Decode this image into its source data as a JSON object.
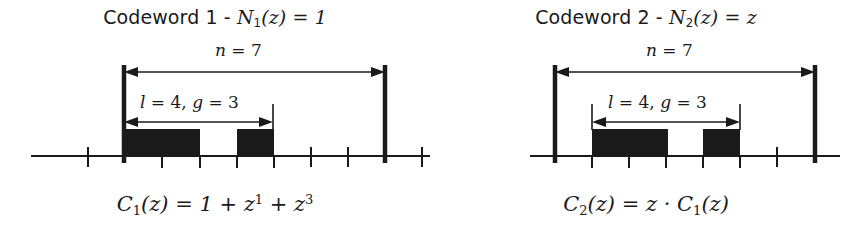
{
  "figure": {
    "background_color": "#ffffff",
    "ink_color": "#1a1a1a",
    "width": 861,
    "height": 235
  },
  "panels": [
    {
      "id": "codeword-1",
      "title_prefix": "Codeword 1 - ",
      "title_symbol": "N",
      "title_symbol_sub": "1",
      "title_symbol_arg": "(z) = 1",
      "title_full": "Codeword 1 - N₁(z) = 1",
      "formula_lead": "C",
      "formula_lead_sub": "1",
      "formula_rest": "(z) = 1 + z",
      "formula_sup_1": "1",
      "formula_mid": " + z",
      "formula_sup_2": "3",
      "formula_full": "C₁(z) = 1 + z¹ + z³",
      "span_label": {
        "var": "n",
        "eq": " = ",
        "value": "7",
        "text": "n = 7"
      },
      "window_label": {
        "var_l": "l",
        "eq_l": " = ",
        "val_l": "4, ",
        "var_g": "g",
        "eq_g": " = ",
        "val_g": "3",
        "text": "l = 4, g = 3"
      },
      "axis": {
        "baseline_y": 156,
        "x_start": 31,
        "x_end": 460,
        "tick_spacing": 37.3,
        "tick_positions": [
          88,
          125,
          162,
          200,
          237,
          274,
          311,
          348,
          385,
          422
        ],
        "tick_top": 148,
        "tick_bottom": 166
      },
      "boundaries": {
        "left_x": 124,
        "right_x": 385,
        "top_y": 65,
        "bottom_y": 163
      },
      "span_arrow": {
        "y": 72,
        "x1": 124,
        "x2": 385
      },
      "window_arrow": {
        "y": 122,
        "x1": 124,
        "x2": 273,
        "tick_x": 273,
        "tick_top": 104,
        "tick_bottom": 130
      },
      "bars": [
        {
          "x": 124,
          "width": 76,
          "top_y": 129,
          "bottom_y": 157
        },
        {
          "x": 237,
          "width": 37,
          "top_y": 129,
          "bottom_y": 157
        }
      ]
    },
    {
      "id": "codeword-2",
      "title_prefix": "Codeword 2 - ",
      "title_symbol": "N",
      "title_symbol_sub": "2",
      "title_symbol_arg": "(z) = z",
      "title_full": "Codeword 2 - N₂(z) = z",
      "formula_lead": "C",
      "formula_lead_sub": "2",
      "formula_rest": "(z) = z · C",
      "formula_sup_1": "",
      "formula_mid": "",
      "formula_sup_2": "",
      "formula_tail_sub": "1",
      "formula_tail": "(z)",
      "formula_full": "C₂(z) = z · C₁(z)",
      "span_label": {
        "var": "n",
        "eq": " = ",
        "value": "7",
        "text": "n = 7"
      },
      "window_label": {
        "var_l": "l",
        "eq_l": " = ",
        "val_l": "4, ",
        "var_g": "g",
        "eq_g": " = ",
        "val_g": "3",
        "text": "l = 4, g = 3"
      },
      "axis": {
        "baseline_y": 156,
        "x_start": 99,
        "x_end": 409,
        "tick_spacing": 37.3,
        "tick_positions": [
          124,
          161,
          198,
          235,
          272,
          309,
          346,
          384
        ],
        "tick_top": 148,
        "tick_bottom": 166
      },
      "boundaries": {
        "left_x": 124,
        "right_x": 384,
        "top_y": 65,
        "bottom_y": 163
      },
      "span_arrow": {
        "y": 72,
        "x1": 124,
        "x2": 384
      },
      "window_arrow": {
        "y": 122,
        "x1": 161,
        "x2": 309,
        "tick_x": 309,
        "tick_top": 104,
        "tick_bottom": 130
      },
      "bars": [
        {
          "x": 161,
          "width": 76,
          "top_y": 129,
          "bottom_y": 157
        },
        {
          "x": 272,
          "width": 37,
          "top_y": 129,
          "bottom_y": 157
        }
      ]
    }
  ],
  "stray_segment": {
    "x1": 422,
    "x2": 462,
    "y": 156
  }
}
